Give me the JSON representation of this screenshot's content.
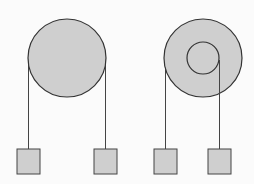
{
  "diagram": {
    "colors": {
      "fill": "#cfcfcf",
      "stroke": "#333333",
      "background": "#fbfbfb"
    },
    "pulleys": [
      {
        "name": "single-pulley",
        "cx": 67,
        "cy": 58,
        "r": 39
      },
      {
        "name": "compound-pulley",
        "cx": 203,
        "cy": 58,
        "r": 39,
        "inner_r": 16
      }
    ],
    "masses": [
      {
        "x": 17,
        "y": 149,
        "w": 23,
        "h": 25
      },
      {
        "x": 94,
        "y": 149,
        "w": 23,
        "h": 25
      },
      {
        "x": 154,
        "y": 149,
        "w": 23,
        "h": 25
      },
      {
        "x": 208,
        "y": 149,
        "w": 23,
        "h": 25
      }
    ]
  }
}
